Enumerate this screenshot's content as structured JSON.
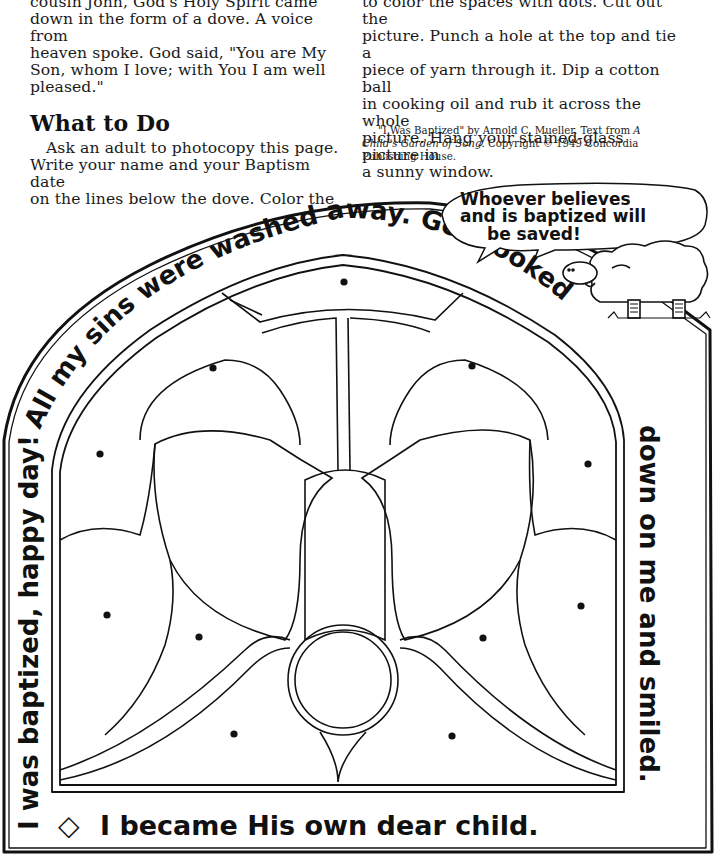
{
  "story": {
    "left_column": {
      "intro_lines": [
        "cousin John, God's Holy Spirit came",
        "down in the form of a dove. A voice from",
        "heaven spoke. God said, \"You are My",
        "Son, whom I love; with You I am well",
        "pleased.\""
      ],
      "heading": "What to Do",
      "instructions_lines": [
        "Ask an adult to photocopy this page.",
        "Write your name and your Baptism date",
        "on the lines below the dove. Color the"
      ]
    },
    "right_column": {
      "lines": [
        "to color the spaces with dots. Cut out the",
        "picture. Punch a hole at the top and tie a",
        "piece of yarn through it. Dip a cotton ball",
        "in cooking oil and rub it across the whole",
        "picture. Hang your stained-glass picture in",
        "a sunny window."
      ]
    },
    "credit": {
      "prefix": "\"I Was Baptized\" by Arnold C. Mueller. Text from ",
      "book_title_a": "A",
      "book_title_b": "Child's Garden of Song.",
      "suffix": " Copyright © 1949 Concordia",
      "last_line": "Publishing House."
    }
  },
  "artwork": {
    "title": "Stained-glass dove coloring page",
    "border_text": {
      "left_side": "I was baptized, happy day!",
      "arch_top": "All my sins were washed away. God looked",
      "right_side": "down on me and smiled.",
      "bottom": "I became His own dear child."
    },
    "diamond_ornament": "◇",
    "speech_bubble": {
      "lines": [
        "Whoever believes",
        "and is baptized will",
        "be saved!"
      ]
    },
    "character": "lamb",
    "dot_count": 14,
    "colors": {
      "ink": "#111111",
      "paper": "#ffffff"
    }
  }
}
